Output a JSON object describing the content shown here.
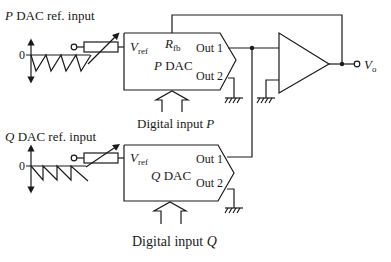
{
  "diagram": {
    "type": "circuit-schematic",
    "p_section": {
      "ref_input_label_var": "P",
      "ref_input_label_text": " DAC ref. input",
      "zero_label": "0",
      "dac_name_var": "P",
      "dac_name_text": " DAC",
      "vref_label": "V",
      "vref_sub": "ref",
      "rfb_label": "R",
      "rfb_sub": "fb",
      "out1_label": "Out 1",
      "out2_label": "Out 2",
      "digital_input_text": "Digital input ",
      "digital_input_var": "P"
    },
    "q_section": {
      "ref_input_label_var": "Q",
      "ref_input_label_text": " DAC ref. input",
      "zero_label": "0",
      "dac_name_var": "Q",
      "dac_name_text": " DAC",
      "vref_label": "V",
      "vref_sub": "ref",
      "out1_label": "Out 1",
      "out2_label": "Out 2",
      "digital_input_text": "Digital input ",
      "digital_input_var": "Q"
    },
    "output": {
      "label": "V",
      "sub": "o"
    },
    "components": [
      "sawtooth-waveform-p",
      "variable-resistor-p",
      "p-dac",
      "sawtooth-waveform-q",
      "variable-resistor-q",
      "q-dac",
      "op-amp",
      "ground-symbols",
      "feedback-path"
    ]
  }
}
